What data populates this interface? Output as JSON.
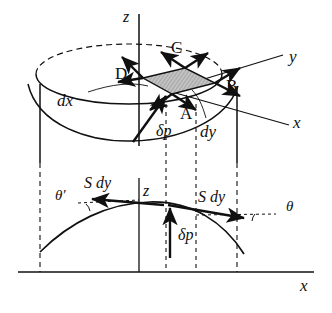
{
  "figure": {
    "background": "#ffffff",
    "ink": "#101010",
    "shade_fill": "#b9b9b9"
  },
  "axes": {
    "top": {
      "z": "z",
      "y": "y",
      "x": "x"
    },
    "bottom": {
      "z": "z",
      "x": "x"
    }
  },
  "top_diagram": {
    "corner_labels": [
      {
        "name": "C",
        "text": "C"
      },
      {
        "name": "D",
        "text": "D"
      },
      {
        "name": "B",
        "text": "B"
      },
      {
        "name": "A",
        "text": "A"
      }
    ],
    "dimension_labels": [
      {
        "name": "dx",
        "text": "dx"
      },
      {
        "name": "dy",
        "text": "dy"
      }
    ],
    "pressure_label": "δp",
    "element_fill": "#b9b9b9",
    "arrow_count": 8
  },
  "bottom_diagram": {
    "tension_left_label": "S dy",
    "tension_right_label": "S dy",
    "angle_left_label": "θ′",
    "angle_right_label": "θ",
    "pressure_label": "δp",
    "axis_z_label": "z",
    "axis_x_label": "x"
  }
}
